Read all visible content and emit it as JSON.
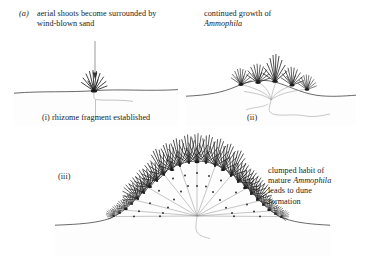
{
  "figure": {
    "panel_marker": "(a)",
    "background_color": "#ffffff",
    "ink_color": "#1a1a1a",
    "sand_color": "#fcfcfc",
    "rhizome_color": "#8d8d8d"
  },
  "stage_i": {
    "caption": "aerial shoots become surrounded by wind-blown sand",
    "label": "(i)  rhizome fragment established",
    "roman": "(i)",
    "label_text": "rhizome fragment established"
  },
  "stage_ii": {
    "caption_line1": "continued growth of",
    "caption_line2": "Ammophila",
    "label": "(ii)"
  },
  "stage_iii": {
    "label": "(iii)",
    "caption_line1": "clumped habit of",
    "caption_line2_pre": "mature ",
    "caption_line2_italic": "Ammophila",
    "caption_line3": "leads to dune",
    "caption_line4": "formation"
  }
}
